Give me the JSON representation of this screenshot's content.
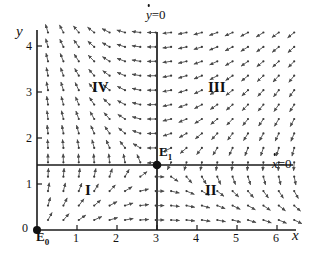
{
  "figure": {
    "type": "phase-portrait",
    "background": "#ffffff",
    "ink": "#1a1a1a",
    "arrow_color": "#4a4a4a"
  },
  "axes": {
    "x_label": "x",
    "y_label": "y",
    "x_ticks": [
      "1",
      "2",
      "3",
      "4",
      "5",
      "6"
    ],
    "y_ticks": [
      "1",
      "2",
      "3",
      "4"
    ],
    "origin_label": "0",
    "x_range": [
      0,
      6.5
    ],
    "y_range": [
      0,
      4.35
    ]
  },
  "nullclines": {
    "vertical": {
      "label_main": "y",
      "label_rest": "=0",
      "x_value": 3
    },
    "horizontal": {
      "label_main": "x",
      "label_rest": "=0",
      "y_value": 1.4
    }
  },
  "equilibria": [
    {
      "name": "E",
      "sub": "0",
      "x": 0,
      "y": 0
    },
    {
      "name": "E",
      "sub": "1",
      "x": 3,
      "y": 1.4
    }
  ],
  "regions": [
    {
      "label": "I",
      "x": 1.72,
      "y": 0.86
    },
    {
      "label": "II",
      "x": 4.28,
      "y": 0.84
    },
    {
      "label": "III",
      "x": 4.4,
      "y": 2.92
    },
    {
      "label": "IV",
      "x": 1.78,
      "y": 2.92
    }
  ],
  "chart_data": {
    "type": "scatter",
    "title": "",
    "xlabel": "x",
    "ylabel": "y",
    "xlim": [
      0,
      6.5
    ],
    "ylim": [
      0,
      4.35
    ],
    "grid": false,
    "legend": "none",
    "annotations": [
      "ẏ=0",
      "ẋ=0",
      "E₀",
      "E₁",
      "I",
      "II",
      "III",
      "IV"
    ],
    "vector_field": {
      "grid_nx": 17,
      "grid_ny": 14,
      "rule": "arrow points right when y<1.4 on the far side, left when y>1.4 right of x=3; vertical component positive left of x=3, negative right of x=3; all trajectories converge toward E1=(3,1.4)"
    }
  }
}
